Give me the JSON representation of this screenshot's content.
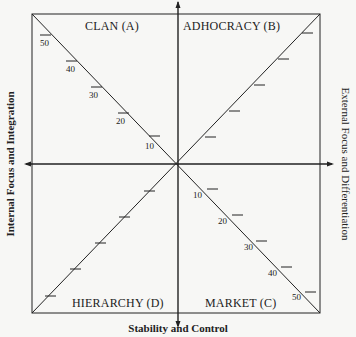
{
  "quadrants": {
    "a": "CLAN (A)",
    "b": "ADHOCRACY (B)",
    "c": "MARKET (C)",
    "d": "HIERARCHY (D)"
  },
  "axes": {
    "left": "Internal Focus and Integration",
    "right": "External Focus and Differentiation",
    "bottom": "Stability and Control"
  },
  "scale_ticks": [
    "10",
    "20",
    "30",
    "40",
    "50"
  ],
  "colors": {
    "line": "#222222",
    "background": "#f7f7f5"
  }
}
